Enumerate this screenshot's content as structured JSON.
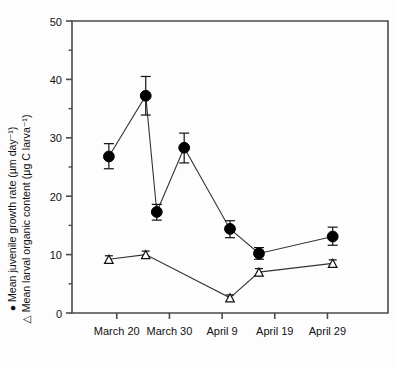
{
  "chart_data": {
    "type": "line",
    "title": "",
    "xlabel": "",
    "ylabel_line1": "● Mean juvenile growth rate (µm day⁻¹)",
    "ylabel_line2": "△ Mean larval organic content (µg C larva⁻¹)",
    "ylim": [
      0,
      50
    ],
    "yticks": [
      0,
      10,
      20,
      30,
      40,
      50
    ],
    "ytick_labels": [
      "0",
      "10",
      "20",
      "30",
      "40",
      "50"
    ],
    "xtick_labels": [
      "March 20",
      "March 30",
      "April 9",
      "April 19",
      "April 29"
    ],
    "xtick_days": [
      20,
      30,
      40,
      50,
      60
    ],
    "xlim_days": [
      11.5,
      71.5
    ],
    "grid": false,
    "legend": "inline-in-axis-label",
    "series": [
      {
        "name": "Mean juvenile growth rate (µm day⁻¹)",
        "marker": "filled-circle",
        "color": "#000000",
        "x_days": [
          18.5,
          25.5,
          27.6,
          32.8,
          41.5,
          47.0,
          61.0
        ],
        "x_labels": [
          "March 18",
          "March 25",
          "March 27",
          "April 2",
          "April 10",
          "April 16",
          "April 30"
        ],
        "values": [
          26.8,
          37.2,
          17.3,
          28.3,
          14.4,
          10.2,
          13.1
        ],
        "err_low": [
          2.1,
          3.3,
          1.4,
          2.6,
          1.5,
          1.0,
          1.5
        ],
        "err_high": [
          2.2,
          3.3,
          1.3,
          2.5,
          1.4,
          1.0,
          1.6
        ]
      },
      {
        "name": "Mean larval organic content (µg C larva⁻¹)",
        "marker": "open-triangle",
        "color": "#000000",
        "x_days": [
          18.5,
          25.5,
          41.5,
          47.0,
          61.0
        ],
        "x_labels": [
          "March 18",
          "March 25",
          "April 10",
          "April 16",
          "April 30"
        ],
        "values": [
          9.2,
          10.0,
          2.6,
          7.0,
          8.5
        ],
        "err_low": [
          0.6,
          0.6,
          0.5,
          0.6,
          0.6
        ],
        "err_high": [
          0.6,
          0.6,
          0.5,
          0.6,
          0.6
        ]
      }
    ]
  },
  "figure": {
    "background": "#ffffff",
    "axis_color": "#4a4a4a",
    "marker_color": "#000000"
  }
}
